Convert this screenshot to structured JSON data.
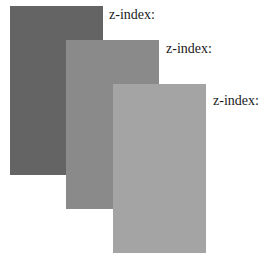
{
  "diagram": {
    "layers": [
      {
        "label": "z-index:",
        "color": "#646464",
        "box": {
          "left": 10,
          "top": 6
        },
        "label_pos": {
          "left": 109,
          "top": 7
        }
      },
      {
        "label": "z-index:",
        "color": "#8a8a8a",
        "box": {
          "left": 66,
          "top": 40
        },
        "label_pos": {
          "left": 166,
          "top": 41
        }
      },
      {
        "label": "z-index:",
        "color": "#a4a4a4",
        "box": {
          "left": 113,
          "top": 84
        },
        "label_pos": {
          "left": 213,
          "top": 93
        }
      }
    ]
  }
}
